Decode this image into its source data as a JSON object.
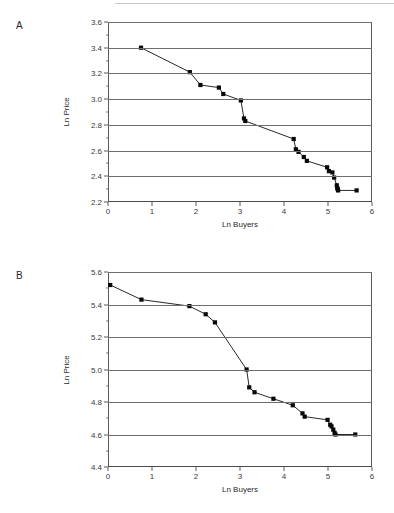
{
  "figure": {
    "panels": [
      {
        "label": "A",
        "chart_data": {
          "type": "line",
          "title": "",
          "xlabel": "Ln Buyers",
          "ylabel": "Ln Price",
          "xlim": [
            0,
            6
          ],
          "ylim": [
            2.2,
            3.6
          ],
          "xticks": [
            0,
            1,
            2,
            3,
            4,
            5,
            6
          ],
          "yticks": [
            2.2,
            2.4,
            2.6,
            2.8,
            3.0,
            3.2,
            3.4,
            3.6
          ],
          "xtick_labels": [
            "0",
            "1",
            "2",
            "3",
            "4",
            "5",
            "6"
          ],
          "ytick_labels": [
            "2.2",
            "2.4",
            "2.6",
            "2.8",
            "3.0",
            "3.2",
            "3.4",
            "3.6"
          ],
          "grid": true,
          "grid_axis": "y",
          "legend": "none",
          "marker": "square",
          "x": [
            0.75,
            1.86,
            2.1,
            2.52,
            2.62,
            3.02,
            3.09,
            3.12,
            4.22,
            4.27,
            4.33,
            4.45,
            4.52,
            4.98,
            5.02,
            5.1,
            5.14,
            5.2,
            5.21,
            5.22,
            5.23,
            5.65
          ],
          "y": [
            3.4,
            3.21,
            3.11,
            3.09,
            3.04,
            2.99,
            2.85,
            2.83,
            2.69,
            2.61,
            2.59,
            2.55,
            2.52,
            2.47,
            2.44,
            2.43,
            2.39,
            2.33,
            2.31,
            2.3,
            2.29,
            2.29
          ]
        }
      },
      {
        "label": "B",
        "chart_data": {
          "type": "line",
          "title": "",
          "xlabel": "Ln Buyers",
          "ylabel": "Ln Price",
          "xlim": [
            0,
            6
          ],
          "ylim": [
            4.4,
            5.6
          ],
          "xticks": [
            0,
            1,
            2,
            3,
            4,
            5,
            6
          ],
          "yticks": [
            4.4,
            4.6,
            4.8,
            5.0,
            5.2,
            5.4,
            5.6
          ],
          "xtick_labels": [
            "0",
            "1",
            "2",
            "3",
            "4",
            "5",
            "6"
          ],
          "ytick_labels": [
            "4.4",
            "4.6",
            "4.8",
            "5.0",
            "5.2",
            "5.4",
            "5.6"
          ],
          "grid": true,
          "grid_axis": "y",
          "legend": "none",
          "marker": "square",
          "x": [
            0.05,
            0.76,
            1.85,
            2.22,
            2.43,
            3.15,
            3.21,
            3.33,
            3.76,
            4.2,
            4.42,
            4.47,
            4.99,
            5.05,
            5.08,
            5.12,
            5.15,
            5.17,
            5.62
          ],
          "y": [
            5.52,
            5.43,
            5.39,
            5.34,
            5.29,
            5.0,
            4.89,
            4.86,
            4.82,
            4.78,
            4.73,
            4.71,
            4.69,
            4.66,
            4.65,
            4.63,
            4.61,
            4.6,
            4.6
          ]
        }
      }
    ]
  }
}
